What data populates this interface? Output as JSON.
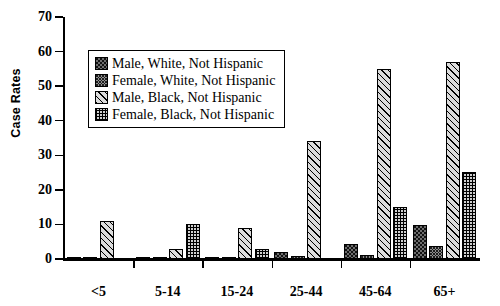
{
  "chart_data": {
    "type": "bar",
    "title": "",
    "xlabel": "",
    "ylabel": "Case Rates",
    "ylim": [
      0,
      70
    ],
    "yticks": [
      0,
      10,
      20,
      30,
      40,
      50,
      60,
      70
    ],
    "grid": false,
    "legend_position": "upper-left-inside",
    "categories": [
      "<5",
      "5-14",
      "15-24",
      "25-44",
      "45-64",
      "65+"
    ],
    "series": [
      {
        "name": "Male, White, Not Hispanic",
        "pattern": "dark-speckle",
        "values": [
          0.6,
          0.3,
          0.5,
          2.0,
          4.2,
          9.8
        ]
      },
      {
        "name": "Female, White, Not Hispanic",
        "pattern": "dense-speckle",
        "values": [
          0.5,
          0.2,
          0.3,
          1.0,
          1.1,
          3.9
        ]
      },
      {
        "name": "Male, Black, Not Hispanic",
        "pattern": "diagonal-hatch",
        "values": [
          11.0,
          2.9,
          9.0,
          34.0,
          55.0,
          57.0
        ]
      },
      {
        "name": "Female, Black, Not Hispanic",
        "pattern": "checker",
        "values": [
          0.0,
          10.2,
          3.0,
          0.0,
          15.0,
          25.2
        ]
      }
    ]
  },
  "legend": {
    "items": [
      {
        "label": "Male, White, Not Hispanic"
      },
      {
        "label": "Female, White, Not Hispanic"
      },
      {
        "label": "Male, Black, Not Hispanic"
      },
      {
        "label": "Female, Black, Not Hispanic"
      }
    ]
  }
}
